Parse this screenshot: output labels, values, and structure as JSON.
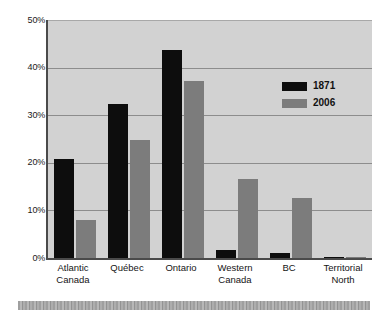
{
  "chart_data": {
    "type": "bar",
    "title": "",
    "subtitle": "",
    "xlabel": "",
    "ylabel": "",
    "ylim": [
      0,
      50
    ],
    "ytick_labels": [
      "50%",
      "40%",
      "30%",
      "20%",
      "10%",
      "0%"
    ],
    "ytick_values": [
      50,
      40,
      30,
      20,
      10,
      0
    ],
    "grid": true,
    "legend_position": "inside-upper-right",
    "categories": [
      "Atlantic\nCanada",
      "Québec",
      "Ontario",
      "Western\nCanada",
      "BC",
      "Territorial\nNorth"
    ],
    "series": [
      {
        "name": "1871",
        "color": "#0d0d0d",
        "values": [
          20.8,
          32.3,
          43.7,
          1.6,
          1.0,
          0.1
        ]
      },
      {
        "name": "2006",
        "color": "#7c7c7c",
        "values": [
          8.0,
          24.8,
          37.2,
          16.5,
          12.7,
          0.3
        ]
      }
    ]
  },
  "figure": {
    "plot_background": "#d2d2d2",
    "axis_color": "#4a4a4a",
    "gridline_color": "#8d8d8d",
    "page_background": "#ffffff",
    "footer_rule_color": "#a0a0a0"
  }
}
